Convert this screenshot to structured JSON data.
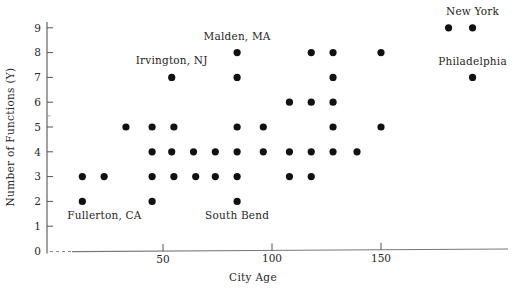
{
  "chart_data": {
    "type": "scatter",
    "title": "",
    "xlabel": "City Age",
    "ylabel": "Number of Functions  (Y)",
    "xlim": [
      0,
      210
    ],
    "ylim": [
      0,
      9.6
    ],
    "xticks": [
      50,
      100,
      150
    ],
    "xticklabels": [
      "50",
      "100",
      "150"
    ],
    "yticks": [
      0,
      1,
      2,
      3,
      4,
      5,
      6,
      7,
      8,
      9
    ],
    "yticklabels": [
      "0",
      "1",
      "2",
      "3",
      "4",
      "5",
      "6",
      "7",
      "8",
      "9"
    ],
    "grid": false,
    "legend": null,
    "marker": "filled-circle",
    "marker_color": "#111111",
    "points": [
      {
        "x": 13,
        "y": 2
      },
      {
        "x": 45,
        "y": 2
      },
      {
        "x": 84,
        "y": 2
      },
      {
        "x": 13,
        "y": 3
      },
      {
        "x": 23,
        "y": 3
      },
      {
        "x": 45,
        "y": 3
      },
      {
        "x": 55,
        "y": 3
      },
      {
        "x": 65,
        "y": 3
      },
      {
        "x": 74,
        "y": 3
      },
      {
        "x": 84,
        "y": 3
      },
      {
        "x": 108,
        "y": 3
      },
      {
        "x": 118,
        "y": 3
      },
      {
        "x": 45,
        "y": 4
      },
      {
        "x": 54,
        "y": 4
      },
      {
        "x": 64,
        "y": 4
      },
      {
        "x": 74,
        "y": 4
      },
      {
        "x": 84,
        "y": 4
      },
      {
        "x": 96,
        "y": 4
      },
      {
        "x": 108,
        "y": 4
      },
      {
        "x": 118,
        "y": 4
      },
      {
        "x": 128,
        "y": 4
      },
      {
        "x": 139,
        "y": 4
      },
      {
        "x": 33,
        "y": 5
      },
      {
        "x": 45,
        "y": 5
      },
      {
        "x": 55,
        "y": 5
      },
      {
        "x": 84,
        "y": 5
      },
      {
        "x": 96,
        "y": 5
      },
      {
        "x": 128,
        "y": 5
      },
      {
        "x": 150,
        "y": 5
      },
      {
        "x": 108,
        "y": 6
      },
      {
        "x": 118,
        "y": 6
      },
      {
        "x": 128,
        "y": 6
      },
      {
        "x": 54,
        "y": 7
      },
      {
        "x": 84,
        "y": 7
      },
      {
        "x": 128,
        "y": 7
      },
      {
        "x": 192,
        "y": 7
      },
      {
        "x": 84,
        "y": 8
      },
      {
        "x": 118,
        "y": 8
      },
      {
        "x": 128,
        "y": 8
      },
      {
        "x": 150,
        "y": 8
      },
      {
        "x": 181,
        "y": 9
      },
      {
        "x": 192,
        "y": 9
      }
    ],
    "annotations": [
      {
        "text": "New York",
        "x": 192,
        "y": 9,
        "align": "mid",
        "dx": 0,
        "dy": -13
      },
      {
        "text": "Philadelphia",
        "x": 192,
        "y": 7,
        "align": "mid",
        "dx": 0,
        "dy": -12
      },
      {
        "text": "Malden, MA",
        "x": 84,
        "y": 8,
        "align": "mid",
        "dx": 0,
        "dy": -13
      },
      {
        "text": "Irvington, NJ",
        "x": 54,
        "y": 7,
        "align": "mid",
        "dx": 0,
        "dy": -13
      },
      {
        "text": "Fullerton, CA",
        "x": 13,
        "y": 2,
        "align": "start",
        "dx": -15,
        "dy": 18
      },
      {
        "text": "South Bend",
        "x": 84,
        "y": 2,
        "align": "mid",
        "dx": 0,
        "dy": 18
      }
    ]
  }
}
